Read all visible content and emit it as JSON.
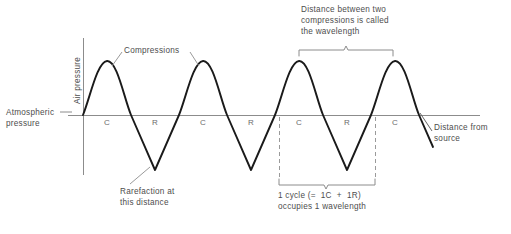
{
  "figure": {
    "title_implicit": "Longitudinal sound wave pressure diagram",
    "axes": {
      "y_axis_label": "Air pressure",
      "x_axis_label": "Distance from\nsource",
      "baseline_label": "Atmospheric\npressure"
    },
    "annotations": {
      "compressions": "Compressions",
      "rarefaction": "Rarefaction at\nthis distance",
      "wavelength_note": "Distance between two\ncompressions is called\nthe wavelength",
      "cycle_note": "1 cycle (=  1C  +  1R)\noccupies 1 wavelength"
    },
    "baseline_markers": [
      {
        "label": "C",
        "x": 107
      },
      {
        "label": "R",
        "x": 155
      },
      {
        "label": "C",
        "x": 203
      },
      {
        "label": "R",
        "x": 251
      },
      {
        "label": "C",
        "x": 299
      },
      {
        "label": "R",
        "x": 347
      },
      {
        "label": "C",
        "x": 395
      }
    ],
    "colors": {
      "wave": "#1a1a1a",
      "axis": "#8c8c8c",
      "text": "#4d4d4d",
      "marker_text": "#6b6b6b",
      "dashed": "#9a9a9a",
      "background": "#ffffff"
    }
  },
  "chart_data": {
    "type": "line",
    "title": "",
    "xlabel": "Distance from source",
    "ylabel": "Air pressure",
    "grid": false,
    "legend": null,
    "baseline_value_label": "Atmospheric pressure",
    "period_px": 96,
    "peak_values": [
      {
        "marker": "C",
        "x": 107
      },
      {
        "marker": "C",
        "x": 203
      },
      {
        "marker": "C",
        "x": 299
      },
      {
        "marker": "C",
        "x": 395
      }
    ],
    "trough_values": [
      {
        "marker": "R",
        "x": 155
      },
      {
        "marker": "R",
        "x": 251
      },
      {
        "marker": "R",
        "x": 347
      }
    ],
    "series": [
      {
        "name": "Air pressure",
        "description": "Wave alternating above (compression, C) and below (rarefaction, R) atmospheric pressure baseline"
      }
    ]
  }
}
